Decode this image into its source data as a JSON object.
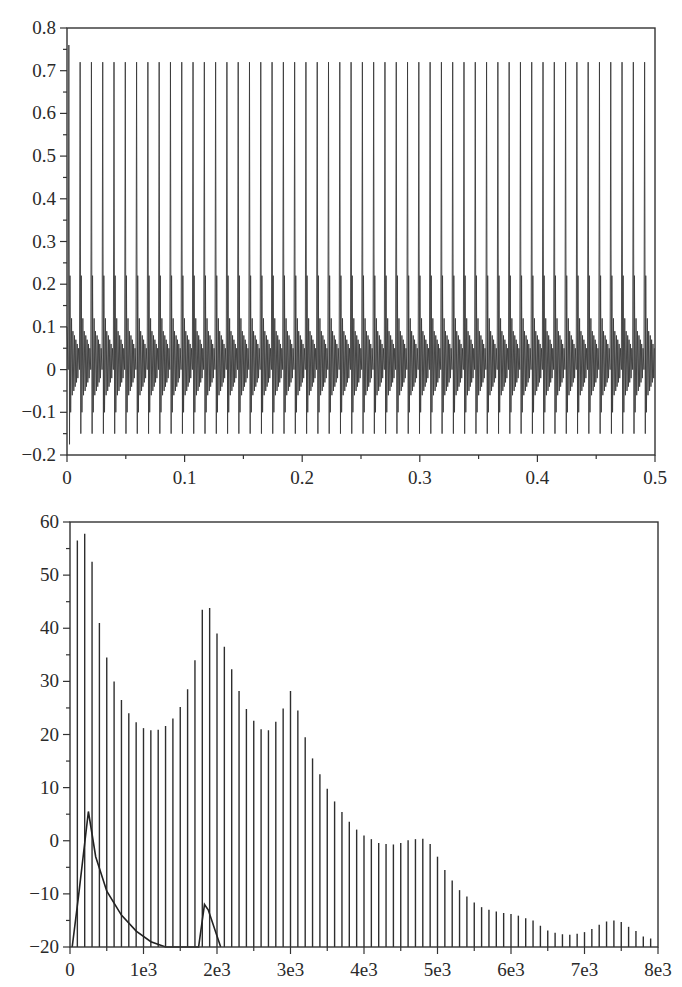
{
  "chart_data": [
    {
      "id": "time-signal",
      "type": "line",
      "title": "",
      "xlabel": "",
      "ylabel": "",
      "xlim": [
        0,
        0.5
      ],
      "ylim": [
        -0.2,
        0.8
      ],
      "grid": false,
      "legend": null,
      "x_ticks": [
        0,
        0.1,
        0.2,
        0.3,
        0.4,
        0.5
      ],
      "x_tick_labels": [
        "0",
        "0.1",
        "0.2",
        "0.3",
        "0.4",
        "0.5"
      ],
      "y_ticks": [
        -0.2,
        -0.1,
        0,
        0.1,
        0.2,
        0.3,
        0.4,
        0.5,
        0.6,
        0.7,
        0.8
      ],
      "y_tick_labels": [
        "−0.2",
        "−0.1",
        "0",
        "0.1",
        "0.2",
        "0.3",
        "0.4",
        "0.5",
        "0.6",
        "0.7",
        "0.8"
      ],
      "description": "Periodic pulse train (glottal-like excitation filtered), ~52 periods over 0.5 s",
      "period_s": 0.0096,
      "num_periods": 52,
      "peak_value": 0.72,
      "first_peak_value": 0.76,
      "min_value": -0.15,
      "first_min_value": -0.175,
      "period_template": {
        "phase": [
          0.0,
          0.06,
          0.12,
          0.16,
          0.22,
          0.3,
          0.36,
          0.42,
          0.5,
          0.56,
          0.62,
          0.68,
          0.74,
          0.8,
          0.86,
          0.92,
          1.0
        ],
        "value": [
          0.0,
          0.72,
          -0.15,
          0.22,
          -0.1,
          0.12,
          -0.06,
          0.09,
          -0.05,
          0.08,
          -0.04,
          0.07,
          -0.03,
          0.06,
          -0.02,
          0.05,
          0.0
        ]
      }
    },
    {
      "id": "spectrum",
      "type": "bar",
      "title": "",
      "xlabel": "",
      "ylabel": "",
      "xlim": [
        0,
        8000
      ],
      "ylim": [
        -20,
        60
      ],
      "grid": false,
      "legend": null,
      "x_ticks": [
        0,
        1000,
        2000,
        3000,
        4000,
        5000,
        6000,
        7000,
        8000
      ],
      "x_tick_labels": [
        "0",
        "1e3",
        "2e3",
        "3e3",
        "4e3",
        "5e3",
        "6e3",
        "7e3",
        "8e3"
      ],
      "y_ticks": [
        -20,
        -10,
        0,
        10,
        20,
        30,
        40,
        50,
        60
      ],
      "y_tick_labels": [
        "−20",
        "−10",
        "0",
        "10",
        "20",
        "30",
        "40",
        "50",
        "60"
      ],
      "description": "Harmonic line spectrum (dB) at multiples of ~100 Hz, plus a smooth envelope curve near the bottom",
      "harmonic_spacing_hz": 100,
      "series": [
        {
          "name": "harmonics",
          "x": [
            100,
            200,
            300,
            400,
            500,
            600,
            700,
            800,
            900,
            1000,
            1100,
            1200,
            1300,
            1400,
            1500,
            1600,
            1700,
            1800,
            1900,
            2000,
            2100,
            2200,
            2300,
            2400,
            2500,
            2600,
            2700,
            2800,
            2900,
            3000,
            3100,
            3200,
            3300,
            3400,
            3500,
            3600,
            3700,
            3800,
            3900,
            4000,
            4100,
            4200,
            4300,
            4400,
            4500,
            4600,
            4700,
            4800,
            4900,
            5000,
            5100,
            5200,
            5300,
            5400,
            5500,
            5600,
            5700,
            5800,
            5900,
            6000,
            6100,
            6200,
            6300,
            6400,
            6500,
            6600,
            6700,
            6800,
            6900,
            7000,
            7100,
            7200,
            7300,
            7400,
            7500,
            7600,
            7700,
            7800,
            7900
          ],
          "values": [
            56.5,
            57.8,
            52.5,
            41,
            34.5,
            30,
            26.5,
            24,
            22.3,
            21.2,
            20.8,
            20.9,
            21.6,
            23,
            25.2,
            28.5,
            34,
            43.5,
            43.8,
            39,
            36.5,
            32.3,
            28.2,
            24.8,
            22.6,
            21,
            20.8,
            22.4,
            24.9,
            28.2,
            24.5,
            19.5,
            15.5,
            12.5,
            9.8,
            7.4,
            5.4,
            3.6,
            2.1,
            1.0,
            0.3,
            -0.4,
            -0.6,
            -0.7,
            -0.4,
            0.1,
            0.3,
            0.4,
            -0.6,
            -3.0,
            -5.5,
            -7.5,
            -9.3,
            -10.5,
            -11.6,
            -12.5,
            -13.0,
            -13.3,
            -13.6,
            -13.8,
            -14.1,
            -14.6,
            -15.0,
            -16.0,
            -16.9,
            -17.3,
            -17.6,
            -17.7,
            -17.5,
            -17.2,
            -16.6,
            -15.8,
            -15.2,
            -15.0,
            -15.3,
            -16.2,
            -17.0,
            -18.0,
            -18.4
          ]
        },
        {
          "name": "envelope",
          "x": [
            30,
            120,
            250,
            350,
            500,
            700,
            900,
            1100,
            1300,
            1750,
            1830,
            1880,
            2050
          ],
          "values": [
            -20,
            -10,
            5.5,
            -3,
            -9.5,
            -14,
            -17,
            -19,
            -20,
            -20,
            -12,
            -13,
            -20
          ]
        }
      ]
    }
  ]
}
